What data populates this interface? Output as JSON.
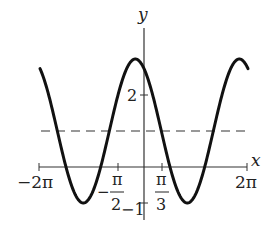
{
  "chart_data": {
    "type": "line",
    "title": "",
    "function": "y = 1 + 2cos(x + π/6)",
    "xlabel": "x",
    "ylabel": "y",
    "xlim": [
      -6.2832,
      6.2832
    ],
    "ylim": [
      -1,
      3
    ],
    "grid": false,
    "legend": null,
    "x_ticks": [
      {
        "value": -6.2832,
        "label": "−2π"
      },
      {
        "value": -1.5708,
        "label_num": "π",
        "label_den": "2",
        "sign": "−"
      },
      {
        "value": 1.0472,
        "label_num": "π",
        "label_den": "3",
        "sign": ""
      },
      {
        "value": 6.2832,
        "label": "2π"
      }
    ],
    "y_ticks": [
      {
        "value": 2,
        "label": "2"
      },
      {
        "value": -1,
        "label": "−1"
      }
    ],
    "series": [
      {
        "name": "curve",
        "style": "solid",
        "x": [
          -6.2832,
          -5.7596,
          -5.236,
          -4.7124,
          -4.1888,
          -3.6652,
          -3.1416,
          -2.618,
          -2.0944,
          -1.5708,
          -1.0472,
          -0.5236,
          0,
          0.5236,
          1.0472,
          1.5708,
          2.0944,
          2.618,
          3.1416,
          3.6652,
          4.1888,
          4.7124,
          5.236,
          5.7596,
          6.2832
        ],
        "values": [
          2.732,
          3.0,
          2.732,
          2.0,
          1.0,
          0.0,
          -0.732,
          -1.0,
          -0.732,
          0.0,
          1.0,
          2.0,
          2.732,
          3.0,
          2.732,
          2.0,
          1.0,
          0.0,
          -0.732,
          -1.0,
          -0.732,
          0.0,
          1.0,
          2.0,
          2.732
        ]
      },
      {
        "name": "midline",
        "style": "dashed",
        "x": [
          -6.2832,
          6.2832
        ],
        "values": [
          1,
          1
        ]
      }
    ],
    "annotations": [
      {
        "type": "extremum",
        "kind": "max",
        "x": -0.5236,
        "y": 3
      },
      {
        "type": "extremum",
        "kind": "min",
        "x": -3.6652,
        "y": -1
      },
      {
        "type": "extremum",
        "kind": "min",
        "x": 2.618,
        "y": -1
      }
    ]
  },
  "labels": {
    "x_axis": "x",
    "y_axis": "y",
    "x_neg_2pi": "−2π",
    "x_pos_2pi": "2π",
    "x_neg_pi2_sign": "−",
    "x_neg_pi2_num": "π",
    "x_neg_pi2_den": "2",
    "x_pi3_num": "π",
    "x_pi3_den": "3",
    "y_tick_2": "2",
    "y_tick_neg1": "−1"
  },
  "style": {
    "curve_color": "#111111",
    "axis_color": "#333333",
    "dash_color": "#333333"
  }
}
